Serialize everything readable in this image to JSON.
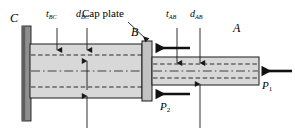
{
  "figure": {
    "type": "engineering-diagram",
    "width": 295,
    "height": 128,
    "background_color": "#ffffff",
    "line_color": "#1a1a1a",
    "tube_fill_color": "#d8d8d8",
    "wall_fill_color": "#9a9a9a",
    "cap_fill_color": "#c2c2c2"
  },
  "points": {
    "c": "C",
    "b": "B",
    "a": "A"
  },
  "dimensions": {
    "t_bc": {
      "symbol": "t",
      "subscript": "BC"
    },
    "d_bc": {
      "symbol": "d",
      "subscript": "BC"
    },
    "t_ab": {
      "symbol": "t",
      "subscript": "AB"
    },
    "d_ab": {
      "symbol": "d",
      "subscript": "AB"
    }
  },
  "annotations": {
    "cap_plate": "Cap plate"
  },
  "loads": {
    "p1": {
      "symbol": "P",
      "subscript": "1",
      "direction": "left"
    },
    "p2": {
      "symbol": "P",
      "subscript": "2",
      "direction": "left"
    }
  }
}
